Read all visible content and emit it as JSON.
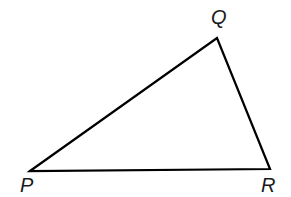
{
  "figure": {
    "kind": "geometry-diagram",
    "shape": "triangle",
    "name": "triangle-PQR",
    "canvas": {
      "width": 291,
      "height": 197
    },
    "background_color": "#ffffff",
    "stroke_color": "#000000",
    "stroke_width": 2.2,
    "fill": "none",
    "label_color": "#1a1a1a",
    "label_font_size": 20,
    "label_style": "italic",
    "vertices": [
      {
        "id": "P",
        "label": "P",
        "x": 30,
        "y": 171,
        "label_x": 20,
        "label_y": 175,
        "label_position": "below-left"
      },
      {
        "id": "Q",
        "label": "Q",
        "x": 217,
        "y": 38,
        "label_x": 211,
        "label_y": 7,
        "label_position": "above"
      },
      {
        "id": "R",
        "label": "R",
        "x": 270,
        "y": 169,
        "label_x": 261,
        "label_y": 175,
        "label_position": "below-right"
      }
    ],
    "edges": [
      {
        "id": "PQ",
        "from": "P",
        "to": "Q"
      },
      {
        "id": "QR",
        "from": "Q",
        "to": "R"
      },
      {
        "id": "RP",
        "from": "R",
        "to": "P"
      }
    ],
    "path": "M 30 171 L 217 38 L 270 169 Z"
  }
}
